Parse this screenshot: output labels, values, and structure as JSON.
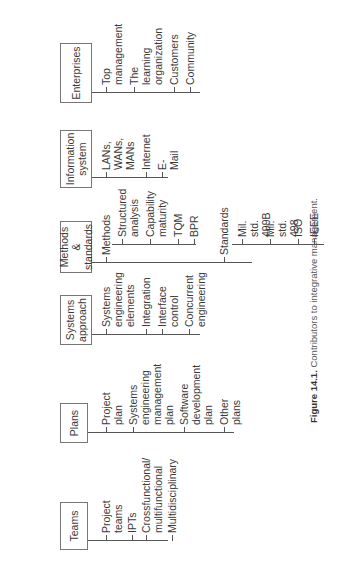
{
  "figure": {
    "caption_label": "Figure 14.1.",
    "caption_text": "Contributors to integrative management."
  },
  "columns": [
    {
      "title": "Teams",
      "items": [
        "Project\nteams",
        "IPTs",
        "Crossfunctional/\nmultifunctional",
        "Multidisciplinary"
      ]
    },
    {
      "title": "Plans",
      "items": [
        "Project\nplan",
        "Systems\nengineering\nmanagement\nplan",
        "Software\ndevelopment\nplan",
        "Other\nplans"
      ]
    },
    {
      "title": "Systems\napproach",
      "items": [
        "Systems\nengineering\nelements",
        "Integration",
        "Interface\ncontrol",
        "Concurrent\nengineering"
      ]
    },
    {
      "title": "Methods &\nstandards",
      "groups": [
        {
          "label": "Methods",
          "items": [
            "Structured\nanalysis",
            "Capability\nmaturity",
            "TQM",
            "BPR"
          ]
        },
        {
          "label": "Standards",
          "items": [
            "Mil. std.\n499B",
            "Mil. std.\n498",
            "ISO",
            "IEEE"
          ]
        }
      ]
    },
    {
      "title": "Information\nsystem",
      "items": [
        "LANs,\nWANs,\nMANs",
        "Internet",
        "E-Mail"
      ]
    },
    {
      "title": "Enterprises",
      "items": [
        "Top\nmanagement",
        "The\nlearning\norganization",
        "Customers",
        "Community"
      ]
    }
  ]
}
